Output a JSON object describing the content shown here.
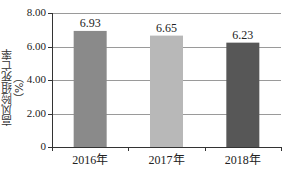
{
  "chart_data": {
    "type": "bar",
    "title": "",
    "xlabel": "",
    "ylabel": "高风险组死亡率（%）",
    "categories": [
      "2016年",
      "2017年",
      "2018年"
    ],
    "values": [
      6.93,
      6.65,
      6.23
    ],
    "value_labels": [
      "6.93",
      "6.65",
      "6.23"
    ],
    "bar_colors": [
      "#8a8a8a",
      "#b8b8b8",
      "#575757"
    ],
    "ylim": [
      0,
      8
    ],
    "yticks": [
      0,
      2,
      4,
      6,
      8
    ],
    "ytick_labels": [
      "0",
      "2.00",
      "4.00",
      "6.00",
      "8.00"
    ],
    "grid": true,
    "legend": null
  }
}
